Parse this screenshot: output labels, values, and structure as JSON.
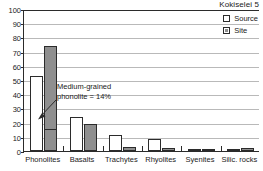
{
  "chart": {
    "title": "Kokiselei 5"
  },
  "legend": {
    "items": [
      {
        "label": "Source",
        "swatch": "open-square",
        "color": "#ffffff"
      },
      {
        "label": "Site",
        "swatch": "filled-square",
        "color": "#8f8f8f"
      }
    ]
  },
  "annotation": {
    "line1": "Medium-grained",
    "line2": "phonolite = 14%",
    "points_to_value": 14,
    "points_to_category": "Phonolites",
    "points_to_series": "Site"
  },
  "axis": {
    "y_ticks": [
      0,
      10,
      20,
      30,
      40,
      50,
      60,
      70,
      80,
      90,
      100
    ],
    "y_min": 0,
    "y_max": 100
  },
  "chart_data": {
    "type": "bar",
    "title": "Kokiselei 5",
    "xlabel": "",
    "ylabel": "",
    "ylim": [
      0,
      100
    ],
    "grid": true,
    "legend_position": "top-right",
    "categories": [
      "Phonolites",
      "Basalts",
      "Trachytes",
      "Rhyolites",
      "Syenites",
      "Silic. rocks"
    ],
    "series": [
      {
        "name": "Source",
        "values": [
          53,
          24,
          11,
          8.5,
          1,
          1
        ]
      },
      {
        "name": "Site",
        "values": [
          74,
          19,
          2.5,
          2,
          0.8,
          2
        ]
      }
    ],
    "annotations": [
      {
        "text": "Medium-grained phonolite = 14%",
        "target_category": "Phonolites",
        "target_series": "Site",
        "target_value": 14
      }
    ]
  }
}
